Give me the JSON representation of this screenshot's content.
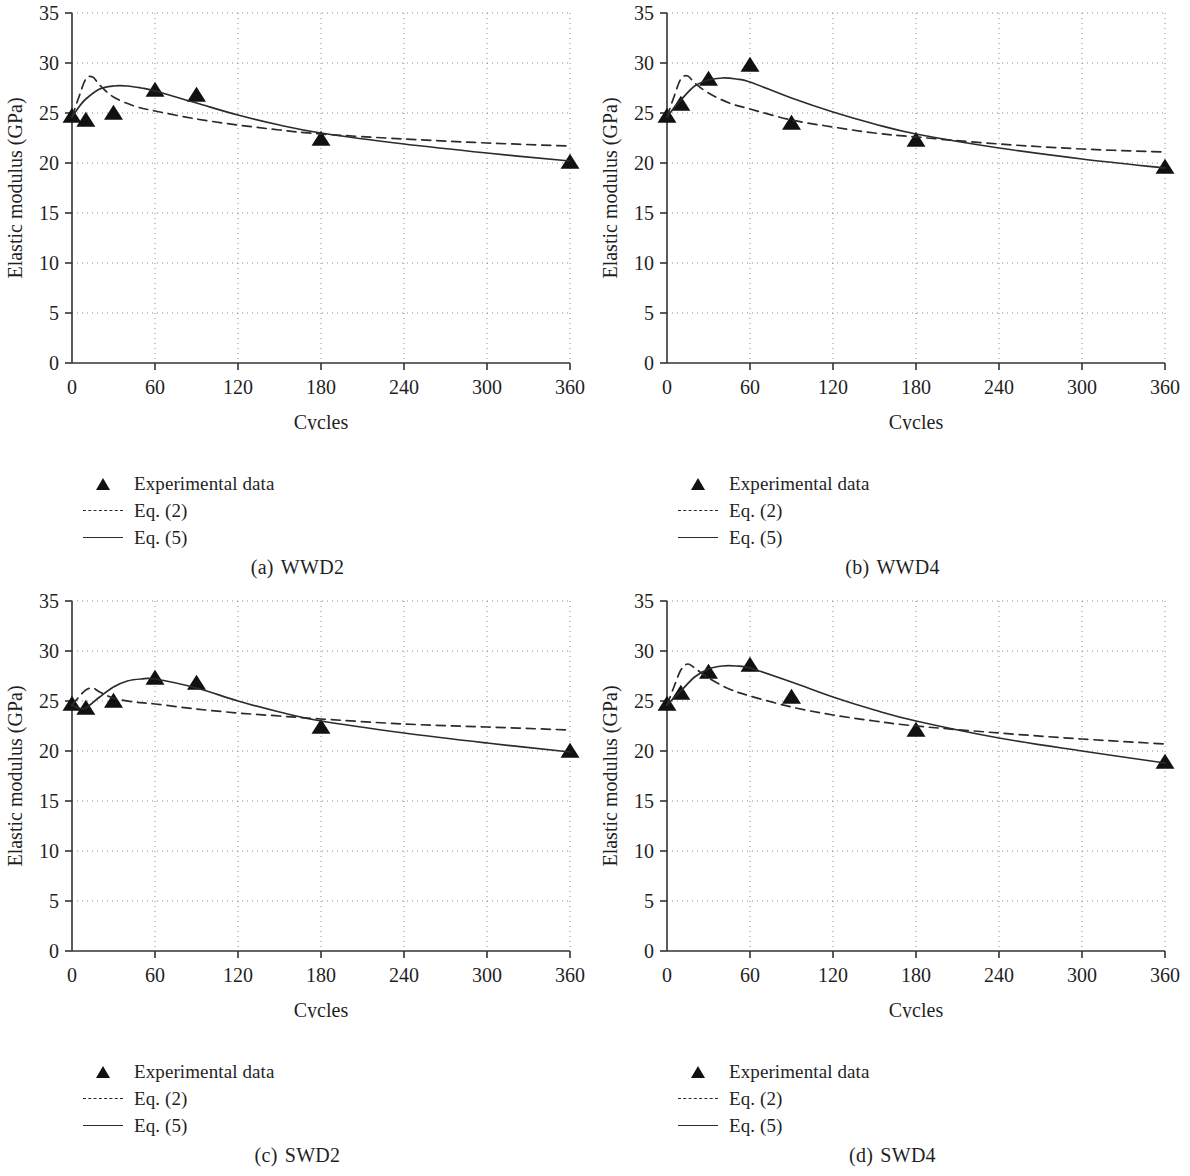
{
  "figure": {
    "panels": [
      {
        "caption_index": "(a)",
        "caption_label": "WWD2",
        "xlabel": "Cycles",
        "ylabel": "Elastic modulus (GPa)",
        "legend": [
          {
            "marker": "triangle-marker",
            "label": "Experimental data"
          },
          {
            "marker": "dashed-line",
            "label": "Eq. (2)"
          },
          {
            "marker": "solid-line",
            "label": "Eq. (5)"
          }
        ]
      },
      {
        "caption_index": "(b)",
        "caption_label": "WWD4",
        "xlabel": "Cycles",
        "ylabel": "Elastic modulus (GPa)",
        "legend": [
          {
            "marker": "triangle-marker",
            "label": "Experimental data"
          },
          {
            "marker": "dashed-line",
            "label": "Eq. (2)"
          },
          {
            "marker": "solid-line",
            "label": "Eq. (5)"
          }
        ]
      },
      {
        "caption_index": "(c)",
        "caption_label": "SWD2",
        "xlabel": "Cycles",
        "ylabel": "Elastic modulus (GPa)",
        "legend": [
          {
            "marker": "triangle-marker",
            "label": "Experimental data"
          },
          {
            "marker": "dashed-line",
            "label": "Eq. (2)"
          },
          {
            "marker": "solid-line",
            "label": "Eq. (5)"
          }
        ]
      },
      {
        "caption_index": "(d)",
        "caption_label": "SWD4",
        "xlabel": "Cycles",
        "ylabel": "Elastic modulus (GPa)",
        "legend": [
          {
            "marker": "triangle-marker",
            "label": "Experimental data"
          },
          {
            "marker": "dashed-line",
            "label": "Eq. (2)"
          },
          {
            "marker": "solid-line",
            "label": "Eq. (5)"
          }
        ]
      }
    ]
  },
  "chart_data": [
    {
      "type": "scatter",
      "panel": "(a) WWD2",
      "title": "WWD2",
      "xlabel": "Cycles",
      "ylabel": "Elastic modulus (GPa)",
      "xlim": [
        0,
        360
      ],
      "ylim": [
        0,
        35
      ],
      "xticks": [
        0,
        60,
        120,
        180,
        240,
        300,
        360
      ],
      "yticks": [
        0,
        5,
        10,
        15,
        20,
        25,
        30,
        35
      ],
      "grid": true,
      "grid_style": "dotted",
      "legend_position": "below-left",
      "series": [
        {
          "name": "Experimental data",
          "style": "triangle-marker",
          "x": [
            0,
            10,
            30,
            60,
            90,
            180,
            360
          ],
          "values": [
            24.6,
            24.2,
            24.9,
            27.2,
            26.7,
            22.3,
            20.0
          ]
        },
        {
          "name": "Eq. (2)",
          "style": "dashed-line",
          "x": [
            0,
            5,
            10,
            15,
            20,
            30,
            45,
            60,
            90,
            120,
            150,
            180,
            240,
            300,
            360
          ],
          "values": [
            24.6,
            26.6,
            28.4,
            28.6,
            27.8,
            26.6,
            25.7,
            25.2,
            24.4,
            23.8,
            23.3,
            22.9,
            22.4,
            22.0,
            21.7
          ]
        },
        {
          "name": "Eq. (5)",
          "style": "solid-line",
          "x": [
            0,
            5,
            10,
            20,
            30,
            40,
            50,
            60,
            90,
            120,
            150,
            180,
            240,
            300,
            360
          ],
          "values": [
            24.6,
            25.6,
            26.4,
            27.4,
            27.7,
            27.7,
            27.5,
            27.2,
            26.0,
            24.8,
            23.8,
            23.0,
            21.9,
            21.0,
            20.2
          ]
        }
      ]
    },
    {
      "type": "scatter",
      "panel": "(b) WWD4",
      "title": "WWD4",
      "xlabel": "Cycles",
      "ylabel": "Elastic modulus (GPa)",
      "xlim": [
        0,
        360
      ],
      "ylim": [
        0,
        35
      ],
      "xticks": [
        0,
        60,
        120,
        180,
        240,
        300,
        360
      ],
      "yticks": [
        0,
        5,
        10,
        15,
        20,
        25,
        30,
        35
      ],
      "grid": true,
      "grid_style": "dotted",
      "legend_position": "below-left",
      "series": [
        {
          "name": "Experimental data",
          "style": "triangle-marker",
          "x": [
            0,
            10,
            30,
            60,
            90,
            180,
            360
          ],
          "values": [
            24.6,
            25.8,
            28.3,
            29.7,
            23.9,
            22.2,
            19.5
          ]
        },
        {
          "name": "Eq. (2)",
          "style": "dashed-line",
          "x": [
            0,
            5,
            10,
            15,
            20,
            30,
            45,
            60,
            90,
            120,
            150,
            180,
            240,
            300,
            360
          ],
          "values": [
            24.6,
            26.6,
            28.4,
            28.7,
            28.0,
            27.0,
            26.0,
            25.4,
            24.3,
            23.6,
            23.0,
            22.6,
            21.9,
            21.4,
            21.1
          ]
        },
        {
          "name": "Eq. (5)",
          "style": "solid-line",
          "x": [
            0,
            5,
            10,
            20,
            30,
            40,
            50,
            60,
            90,
            120,
            150,
            180,
            240,
            300,
            360
          ],
          "values": [
            24.6,
            25.5,
            26.3,
            27.7,
            28.3,
            28.5,
            28.4,
            28.1,
            26.5,
            25.1,
            23.9,
            22.9,
            21.5,
            20.4,
            19.5
          ]
        }
      ]
    },
    {
      "type": "scatter",
      "panel": "(c) SWD2",
      "title": "SWD2",
      "xlabel": "Cycles",
      "ylabel": "Elastic modulus (GPa)",
      "xlim": [
        0,
        360
      ],
      "ylim": [
        0,
        35
      ],
      "xticks": [
        0,
        60,
        120,
        180,
        240,
        300,
        360
      ],
      "yticks": [
        0,
        5,
        10,
        15,
        20,
        25,
        30,
        35
      ],
      "grid": true,
      "grid_style": "dotted",
      "legend_position": "below-left",
      "series": [
        {
          "name": "Experimental data",
          "style": "triangle-marker",
          "x": [
            0,
            10,
            30,
            60,
            90,
            180,
            360
          ],
          "values": [
            24.6,
            24.2,
            24.9,
            27.2,
            26.7,
            22.3,
            19.9
          ]
        },
        {
          "name": "Eq. (2)",
          "style": "dashed-line",
          "x": [
            0,
            5,
            10,
            15,
            20,
            30,
            45,
            60,
            90,
            120,
            150,
            180,
            240,
            300,
            360
          ],
          "values": [
            24.6,
            25.4,
            26.1,
            26.3,
            25.9,
            25.3,
            24.9,
            24.7,
            24.2,
            23.8,
            23.5,
            23.2,
            22.7,
            22.4,
            22.1
          ]
        },
        {
          "name": "Eq. (5)",
          "style": "solid-line",
          "x": [
            0,
            5,
            10,
            20,
            30,
            40,
            50,
            60,
            90,
            120,
            150,
            180,
            240,
            300,
            360
          ],
          "values": [
            24.6,
            24.3,
            24.3,
            25.4,
            26.4,
            27.0,
            27.2,
            27.2,
            26.3,
            25.0,
            23.9,
            23.0,
            21.8,
            20.8,
            19.9
          ]
        }
      ]
    },
    {
      "type": "scatter",
      "panel": "(d) SWD4",
      "title": "SWD4",
      "xlabel": "Cycles",
      "ylabel": "Elastic modulus (GPa)",
      "xlim": [
        0,
        360
      ],
      "ylim": [
        0,
        35
      ],
      "xticks": [
        0,
        60,
        120,
        180,
        240,
        300,
        360
      ],
      "yticks": [
        0,
        5,
        10,
        15,
        20,
        25,
        30,
        35
      ],
      "grid": true,
      "grid_style": "dotted",
      "legend_position": "below-left",
      "series": [
        {
          "name": "Experimental data",
          "style": "triangle-marker",
          "x": [
            0,
            10,
            30,
            60,
            90,
            180,
            360
          ],
          "values": [
            24.6,
            25.7,
            27.8,
            28.5,
            25.3,
            22.0,
            18.8
          ]
        },
        {
          "name": "Eq. (2)",
          "style": "dashed-line",
          "x": [
            0,
            5,
            10,
            15,
            20,
            30,
            45,
            60,
            90,
            120,
            150,
            180,
            240,
            300,
            360
          ],
          "values": [
            24.6,
            26.4,
            28.1,
            28.7,
            28.3,
            27.3,
            26.2,
            25.5,
            24.4,
            23.6,
            23.0,
            22.5,
            21.8,
            21.2,
            20.7
          ]
        },
        {
          "name": "Eq. (5)",
          "style": "solid-line",
          "x": [
            0,
            5,
            10,
            20,
            30,
            40,
            50,
            60,
            90,
            120,
            150,
            180,
            240,
            300,
            360
          ],
          "values": [
            24.6,
            25.3,
            26.0,
            27.4,
            28.2,
            28.5,
            28.5,
            28.3,
            26.9,
            25.4,
            24.1,
            23.0,
            21.3,
            20.0,
            18.8
          ]
        }
      ]
    }
  ]
}
